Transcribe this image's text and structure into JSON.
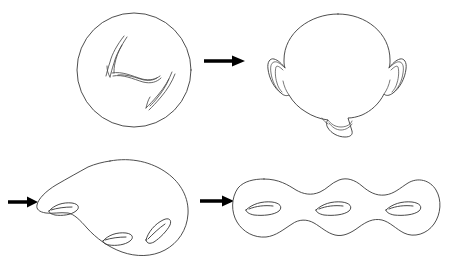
{
  "figure": {
    "title": "Deformation of a sphere with three slits into a genus-three surface",
    "background_color": "#ffffff",
    "line_color": "#3a3a3a",
    "arrow_color": "#000000",
    "width": 452,
    "height": 269,
    "panel_count": 4,
    "arrow_count": 3
  },
  "panels": [
    {
      "id": "panel-sphere-with-slits",
      "label": "Sphere with three slits",
      "row": "top",
      "column": "left",
      "shape_type": "circle",
      "center_x": 134,
      "center_y": 70,
      "radius": 57,
      "feature_name": "slit",
      "feature_count": 3,
      "features": [
        {
          "name": "slit-upper-left",
          "x": 111,
          "y": 53,
          "angle_deg": 70
        },
        {
          "name": "slit-center",
          "x": 134,
          "y": 77,
          "angle_deg": 0
        },
        {
          "name": "slit-lower-right",
          "x": 160,
          "y": 92,
          "angle_deg": 62
        }
      ]
    },
    {
      "id": "panel-sphere-with-handles",
      "label": "Sphere with three handles",
      "row": "top",
      "column": "right",
      "shape_type": "circle-with-handles",
      "center_x": 338,
      "center_y": 66,
      "radius": 52,
      "feature_name": "handle",
      "feature_count": 3,
      "features": [
        {
          "name": "handle-left",
          "x": 276,
          "y": 68,
          "angle_deg": 180
        },
        {
          "name": "handle-right",
          "x": 399,
          "y": 68,
          "angle_deg": 0
        },
        {
          "name": "handle-bottom",
          "x": 340,
          "y": 123,
          "angle_deg": 270
        }
      ]
    },
    {
      "id": "panel-blob-genus-three",
      "label": "Deformed blob with three holes",
      "row": "bottom",
      "column": "left",
      "shape_type": "blob",
      "center_x": 112,
      "center_y": 205,
      "feature_name": "hole",
      "feature_count": 3,
      "features": [
        {
          "name": "hole-left",
          "x": 63,
          "y": 208,
          "angle_deg": 12
        },
        {
          "name": "hole-center",
          "x": 117,
          "y": 238,
          "angle_deg": 14
        },
        {
          "name": "hole-right",
          "x": 158,
          "y": 231,
          "angle_deg": 40
        }
      ]
    },
    {
      "id": "panel-genus-three-surface",
      "label": "Genus-three surface",
      "row": "bottom",
      "column": "right",
      "shape_type": "three-holed-torus",
      "center_x": 336,
      "center_y": 208,
      "feature_name": "hole",
      "feature_count": 3,
      "features": [
        {
          "name": "hole-left",
          "x": 264,
          "y": 210,
          "angle_deg": 0
        },
        {
          "name": "hole-center",
          "x": 334,
          "y": 210,
          "angle_deg": 0
        },
        {
          "name": "hole-right",
          "x": 404,
          "y": 210,
          "angle_deg": 0
        }
      ]
    }
  ],
  "arrows": [
    {
      "id": "arrow-top",
      "label": "top transition arrow",
      "direction": "right",
      "x1": 204,
      "y1": 61,
      "x2": 245,
      "y2": 61
    },
    {
      "id": "arrow-bottom-left",
      "label": "bottom incoming arrow",
      "direction": "right",
      "x1": 8,
      "y1": 202,
      "x2": 38,
      "y2": 202
    },
    {
      "id": "arrow-bottom-middle",
      "label": "bottom transition arrow",
      "direction": "right",
      "x1": 200,
      "y1": 201,
      "x2": 234,
      "y2": 201
    }
  ]
}
